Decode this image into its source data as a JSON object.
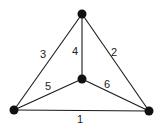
{
  "diagram": {
    "type": "graph",
    "nodes": [
      {
        "id": "top",
        "x": 82,
        "y": 14
      },
      {
        "id": "center",
        "x": 82,
        "y": 79
      },
      {
        "id": "bottom-left",
        "x": 14,
        "y": 110
      },
      {
        "id": "bottom-right",
        "x": 149,
        "y": 111
      }
    ],
    "edges": [
      {
        "label": "1",
        "from": "bottom-left",
        "to": "bottom-right",
        "lx": 80,
        "ly": 122
      },
      {
        "label": "2",
        "from": "top",
        "to": "bottom-right",
        "lx": 114,
        "ly": 56
      },
      {
        "label": "3",
        "from": "top",
        "to": "bottom-left",
        "lx": 43,
        "ly": 58
      },
      {
        "label": "4",
        "from": "top",
        "to": "center",
        "lx": 75,
        "ly": 55
      },
      {
        "label": "5",
        "from": "bottom-left",
        "to": "center",
        "lx": 48,
        "ly": 90
      },
      {
        "label": "6",
        "from": "center",
        "to": "bottom-right",
        "lx": 107,
        "ly": 88
      }
    ]
  }
}
